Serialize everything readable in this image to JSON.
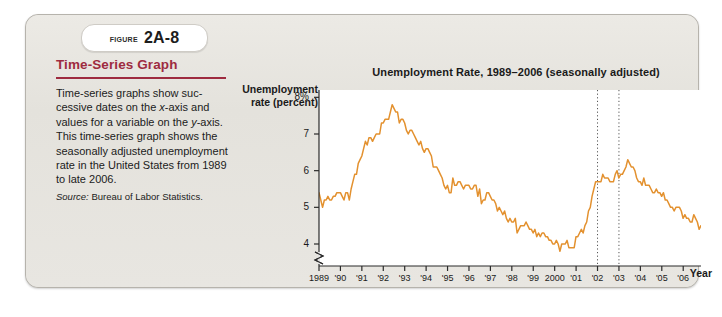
{
  "figure": {
    "badge_word": "Figure",
    "badge_number": "2A-8"
  },
  "sidebar": {
    "title": "Time-Series Graph",
    "body_part1": "Time-series graphs show suc-cessive dates on the ",
    "body_x": "x",
    "body_part2": "-axis and values for a variable on the ",
    "body_y": "y",
    "body_part3": "-axis. This time-series graph shows the seasonally adjusted unemployment rate in the United States from 1989 to late 2006.",
    "source_label": "Source:",
    "source_value": " Bureau of Labor Statistics.",
    "accent_color": "#9e2b3f"
  },
  "chart_data": {
    "type": "line",
    "title": "Unemployment Rate, 1989–2006 (seasonally adjusted)",
    "ylabel": "Unemployment rate (percent)",
    "xlabel": "Year",
    "ylim": [
      3.4,
      8.2
    ],
    "y_ticks": [
      "8%",
      "7",
      "6",
      "5",
      "4"
    ],
    "y_tick_values": [
      8,
      7,
      6,
      5,
      4
    ],
    "y_axis_break": true,
    "xlim": [
      1989.0,
      2006.83
    ],
    "x_ticks": [
      "1989",
      "'90",
      "'91",
      "'92",
      "'93",
      "'94",
      "'95",
      "'96",
      "'97",
      "'98",
      "'99",
      "2000",
      "'01",
      "'02",
      "'03",
      "'04",
      "'05",
      "'06"
    ],
    "x_tick_values": [
      1989,
      1990,
      1991,
      1992,
      1993,
      1994,
      1995,
      1996,
      1997,
      1998,
      1999,
      2000,
      2001,
      2002,
      2003,
      2004,
      2005,
      2006
    ],
    "grid": false,
    "legend": null,
    "line_color": "#e3912f",
    "annotations": [
      {
        "type": "vline",
        "style": "dotted",
        "x": 2002.0,
        "label": "'02"
      },
      {
        "type": "vline",
        "style": "dotted",
        "x": 2003.0,
        "label": "'03"
      }
    ],
    "series": [
      {
        "name": "Unemployment rate (seasonally adjusted)",
        "x_start": 1989.0,
        "x_step": 0.0833,
        "values": [
          5.4,
          5.2,
          5.0,
          5.2,
          5.2,
          5.3,
          5.2,
          5.2,
          5.3,
          5.3,
          5.4,
          5.4,
          5.4,
          5.3,
          5.2,
          5.4,
          5.4,
          5.2,
          5.5,
          5.7,
          5.9,
          5.9,
          6.2,
          6.3,
          6.4,
          6.6,
          6.8,
          6.7,
          6.9,
          6.9,
          6.8,
          6.9,
          7.0,
          7.0,
          7.0,
          7.3,
          7.3,
          7.4,
          7.4,
          7.4,
          7.6,
          7.8,
          7.7,
          7.6,
          7.6,
          7.3,
          7.4,
          7.4,
          7.3,
          7.1,
          7.0,
          7.1,
          7.1,
          7.0,
          6.9,
          6.8,
          6.7,
          6.8,
          6.6,
          6.5,
          6.6,
          6.6,
          6.5,
          6.4,
          6.1,
          6.1,
          6.1,
          6.0,
          5.9,
          5.8,
          5.6,
          5.5,
          5.6,
          5.4,
          5.4,
          5.8,
          5.6,
          5.6,
          5.7,
          5.7,
          5.6,
          5.5,
          5.6,
          5.6,
          5.6,
          5.5,
          5.5,
          5.6,
          5.6,
          5.3,
          5.5,
          5.1,
          5.2,
          5.2,
          5.4,
          5.4,
          5.3,
          5.2,
          5.2,
          5.1,
          4.9,
          5.0,
          4.9,
          4.8,
          4.9,
          4.7,
          4.6,
          4.7,
          4.6,
          4.6,
          4.7,
          4.3,
          4.4,
          4.5,
          4.5,
          4.5,
          4.6,
          4.5,
          4.4,
          4.4,
          4.3,
          4.4,
          4.2,
          4.3,
          4.2,
          4.3,
          4.3,
          4.2,
          4.2,
          4.1,
          4.1,
          4.0,
          4.0,
          4.1,
          4.0,
          3.8,
          4.0,
          4.0,
          4.0,
          4.1,
          3.9,
          3.9,
          3.9,
          3.9,
          4.2,
          4.2,
          4.3,
          4.4,
          4.3,
          4.5,
          4.6,
          4.9,
          5.0,
          5.3,
          5.5,
          5.7,
          5.7,
          5.7,
          5.7,
          5.9,
          5.8,
          5.8,
          5.8,
          5.7,
          5.7,
          5.7,
          5.9,
          6.0,
          5.8,
          5.9,
          5.9,
          6.0,
          6.1,
          6.3,
          6.2,
          6.1,
          6.1,
          6.0,
          5.8,
          5.7,
          5.7,
          5.6,
          5.8,
          5.6,
          5.6,
          5.6,
          5.5,
          5.4,
          5.4,
          5.5,
          5.4,
          5.4,
          5.3,
          5.4,
          5.2,
          5.2,
          5.1,
          5.0,
          5.0,
          4.9,
          5.0,
          5.0,
          5.0,
          4.9,
          4.7,
          4.8,
          4.7,
          4.7,
          4.6,
          4.6,
          4.8,
          4.7,
          4.6,
          4.4,
          4.5
        ]
      }
    ]
  }
}
